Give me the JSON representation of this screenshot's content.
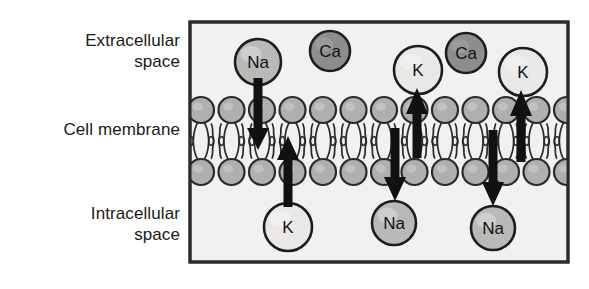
{
  "diagram": {
    "labels": {
      "extracellular": "Extracellular\nspace",
      "cell_membrane": "Cell membrane",
      "intracellular": "Intracellular\nspace"
    },
    "colors": {
      "background": "#ffffff",
      "panel_fill": "#f2f1ef",
      "panel_border": "#2b2b2b",
      "ion_na_fill": "#b9b9b7",
      "ion_ca_fill": "#8d8d8b",
      "ion_k_fill": "#e9e8e6",
      "ion_stroke": "#1d1d1d",
      "lipid_head_fill": "#b0afad",
      "lipid_stroke": "#2a2a2a",
      "arrow_fill": "#111111",
      "text": "#111111"
    },
    "panel": {
      "x": 190,
      "y": 22,
      "width": 378,
      "height": 240
    },
    "membrane": {
      "top_head_row_y": 110,
      "bottom_head_row_y": 172,
      "head_radius": 13,
      "head_count": 13,
      "first_head_cx": 201,
      "head_spacing": 30.5
    },
    "ions": [
      {
        "id": "na-extracellular-1",
        "label": "Na",
        "species": "Na",
        "compartment": "extracellular",
        "cx": 258,
        "cy": 62,
        "r": 23,
        "fill_key": "ion_na_fill"
      },
      {
        "id": "ca-extracellular-1",
        "label": "Ca",
        "species": "Ca",
        "compartment": "extracellular",
        "cx": 330,
        "cy": 51,
        "r": 20,
        "fill_key": "ion_ca_fill"
      },
      {
        "id": "k-extracellular-1",
        "label": "K",
        "species": "K",
        "compartment": "extracellular",
        "cx": 418,
        "cy": 70,
        "r": 24,
        "fill_key": "ion_k_fill"
      },
      {
        "id": "ca-extracellular-2",
        "label": "Ca",
        "species": "Ca",
        "compartment": "extracellular",
        "cx": 466,
        "cy": 53,
        "r": 20,
        "fill_key": "ion_ca_fill"
      },
      {
        "id": "k-extracellular-2",
        "label": "K",
        "species": "K",
        "compartment": "extracellular",
        "cx": 523,
        "cy": 72,
        "r": 24,
        "fill_key": "ion_k_fill"
      },
      {
        "id": "k-intracellular-1",
        "label": "K",
        "species": "K",
        "compartment": "intracellular",
        "cx": 288,
        "cy": 227,
        "r": 24,
        "fill_key": "ion_k_fill"
      },
      {
        "id": "na-intracellular-1",
        "label": "Na",
        "species": "Na",
        "compartment": "intracellular",
        "cx": 394,
        "cy": 223,
        "r": 22,
        "fill_key": "ion_na_fill"
      },
      {
        "id": "na-intracellular-2",
        "label": "Na",
        "species": "Na",
        "compartment": "intracellular",
        "cx": 493,
        "cy": 228,
        "r": 22,
        "fill_key": "ion_na_fill"
      }
    ],
    "arrows": [
      {
        "id": "arrow-na-influx-1",
        "species": "Na",
        "direction": "down",
        "x": 258,
        "y_start": 78,
        "y_end": 150,
        "width": 9,
        "head_width": 22,
        "head_length": 22
      },
      {
        "id": "arrow-k-efflux-1",
        "species": "K",
        "direction": "up",
        "x": 288,
        "y_start": 207,
        "y_end": 136,
        "width": 9,
        "head_width": 22,
        "head_length": 24
      },
      {
        "id": "arrow-k-influx-2",
        "species": "K",
        "direction": "up",
        "x": 417,
        "y_start": 158,
        "y_end": 88,
        "width": 9,
        "head_width": 22,
        "head_length": 26
      },
      {
        "id": "arrow-na-efflux-2",
        "species": "Na",
        "direction": "down",
        "x": 395,
        "y_start": 128,
        "y_end": 201,
        "width": 9,
        "head_width": 22,
        "head_length": 24
      },
      {
        "id": "arrow-k-influx-3",
        "species": "K",
        "direction": "up",
        "x": 521,
        "y_start": 162,
        "y_end": 90,
        "width": 9,
        "head_width": 22,
        "head_length": 26
      },
      {
        "id": "arrow-na-efflux-3",
        "species": "Na",
        "direction": "down",
        "x": 493,
        "y_start": 130,
        "y_end": 206,
        "width": 9,
        "head_width": 22,
        "head_length": 24
      }
    ]
  }
}
